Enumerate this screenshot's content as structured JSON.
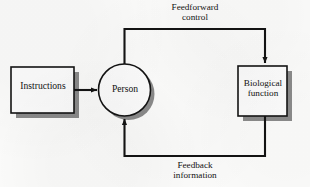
{
  "figure": {
    "type": "block-diagram",
    "background_color": "#fbfbfa",
    "line_color": "#131313",
    "shadow_color": "#8a8a8a",
    "node_fill": "#fcfcfc"
  },
  "nodes": {
    "instructions": {
      "label": "Instructions",
      "shape": "rectangle"
    },
    "person": {
      "label": "Person",
      "shape": "circle"
    },
    "biological_function": {
      "label": "Biological\nfunction",
      "shape": "rectangle"
    }
  },
  "edges": {
    "instructions_to_person": {
      "label": "",
      "from": "instructions",
      "to": "person",
      "arrow": "single"
    },
    "feedforward": {
      "label": "Feedforward\ncontrol",
      "from": "person",
      "to": "biological_function",
      "arrow": "single"
    },
    "feedback": {
      "label": "Feedback\ninformation",
      "from": "biological_function",
      "to": "person",
      "arrow": "single"
    }
  }
}
